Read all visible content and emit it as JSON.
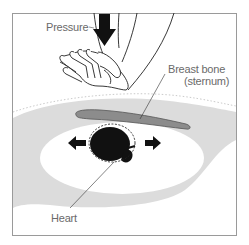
{
  "diagram": {
    "labels": {
      "pressure": "Pressure",
      "breast_bone": "Breast bone",
      "sternum": "(sternum)",
      "heart": "Heart"
    },
    "colors": {
      "frame": "#9a9a9a",
      "chest_tissue": "#dcdcdc",
      "sternum": "#8c8c8c",
      "sternum_outline": "#555555",
      "heart": "#111111",
      "arrow": "#111111",
      "line": "#333333",
      "label_text": "#6a6a6a"
    },
    "icons": {
      "pressure_arrow": "arrow-down-icon",
      "left_arrow": "arrow-left-icon",
      "right_arrow": "arrow-right-icon"
    }
  }
}
